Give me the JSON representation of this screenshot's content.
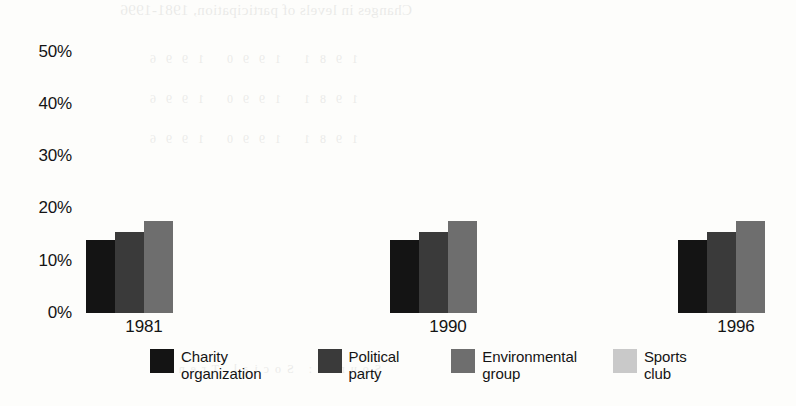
{
  "chart_data": {
    "type": "bar",
    "title": "",
    "xlabel": "",
    "ylabel": "",
    "categories": [
      "1981",
      "1990",
      "1996"
    ],
    "series": [
      {
        "name": "Charity organization",
        "values": [
          14,
          14,
          31
        ],
        "color": "#141414"
      },
      {
        "name": "Political party",
        "values": [
          19.5,
          15.5,
          20.5
        ],
        "color": "#3a3a3a"
      },
      {
        "name": "Environmental group",
        "values": [
          6.5,
          16.5,
          17.5
        ],
        "color": "#6e6e6e"
      },
      {
        "name": "Sports club",
        "values": [
          32,
          35,
          56
        ],
        "color": "#c9c9c9"
      }
    ],
    "ylim": [
      0,
      50
    ],
    "yticks": [
      50,
      40,
      30,
      20,
      10,
      0
    ],
    "ytick_labels": [
      "50%",
      "40%",
      "30%",
      "20%",
      "10%",
      "0%"
    ],
    "grid": false,
    "legend_position": "bottom"
  },
  "axis": {
    "y_ticks": [
      {
        "label": "50%",
        "value": 50
      },
      {
        "label": "40%",
        "value": 40
      },
      {
        "label": "30%",
        "value": 30
      },
      {
        "label": "20%",
        "value": 20
      },
      {
        "label": "10%",
        "value": 10
      },
      {
        "label": "0%",
        "value": 0
      }
    ]
  },
  "groups": [
    {
      "label": "1981"
    },
    {
      "label": "1990"
    },
    {
      "label": "1996"
    }
  ],
  "legend": {
    "items": [
      {
        "label_line1": "Charity",
        "label_line2": "organization",
        "color": "#141414"
      },
      {
        "label_line1": "Political",
        "label_line2": "party",
        "color": "#3a3a3a"
      },
      {
        "label_line1": "Environmental",
        "label_line2": "group",
        "color": "#6e6e6e"
      },
      {
        "label_line1": "Sports",
        "label_line2": "club",
        "color": "#c9c9c9"
      }
    ]
  },
  "bleed_through": {
    "title": "Changes in levels of participation, 1981-1996",
    "row_a": "1981 1990 1996",
    "row_b": "1981 1990 1996",
    "row_c": "1981 1990 1996",
    "row_d": "Source: Social Trends"
  }
}
